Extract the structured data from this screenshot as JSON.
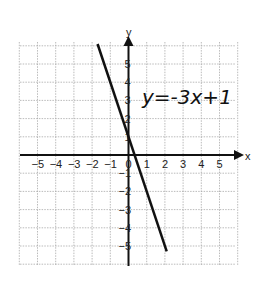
{
  "chart_data": {
    "type": "line",
    "title": "",
    "xlabel": "x",
    "ylabel": "y",
    "xlim": [
      -5.9,
      6
    ],
    "ylim": [
      -6,
      6.2
    ],
    "grid": true,
    "x_ticks": [
      "−5",
      "−4",
      "−3",
      "−2",
      "−1",
      "0",
      "1",
      "2",
      "3",
      "4",
      "5"
    ],
    "y_ticks": [
      "5",
      "4",
      "3",
      "2",
      "1",
      "−1",
      "−2",
      "−3",
      "−4",
      "−5"
    ],
    "series": [
      {
        "name": "y=-3x+1",
        "slope": -3,
        "intercept": 1,
        "x": [
          -1.7,
          2.1
        ],
        "y": [
          6.1,
          -5.3
        ]
      }
    ],
    "annotations": [
      {
        "text": "y=-3x+1",
        "x": 1.1,
        "y": 3.2
      }
    ]
  },
  "labels": {
    "x_axis": "x",
    "y_axis": "y",
    "equation": "y=-3x+1",
    "xt": [
      "−5",
      "−4",
      "−3",
      "−2",
      "−1",
      "0",
      "1",
      "2",
      "3",
      "4",
      "5"
    ],
    "yt": [
      "5",
      "4",
      "3",
      "2",
      "1",
      "−1",
      "−2",
      "−3",
      "−4",
      "−5"
    ]
  }
}
